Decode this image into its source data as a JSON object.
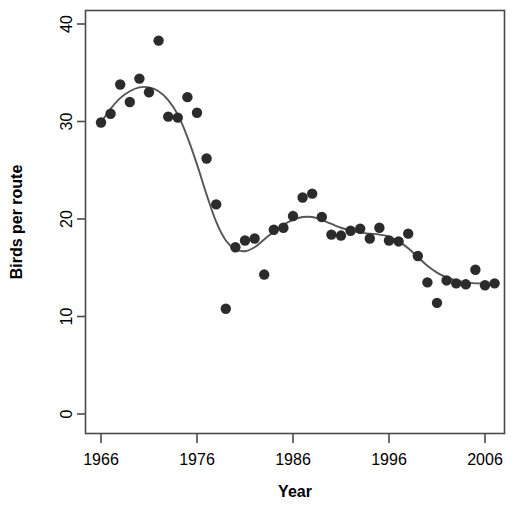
{
  "chart_data": {
    "type": "scatter",
    "title": "",
    "xlabel": "Year",
    "ylabel": "Birds per route",
    "xlim": [
      1965.0,
      2008.0
    ],
    "ylim": [
      0,
      41.5
    ],
    "xticks": [
      1966,
      1976,
      1986,
      1996,
      2006
    ],
    "xtick_labels": [
      "1966",
      "1976",
      "1986",
      "1996",
      "2006"
    ],
    "yticks": [
      0,
      10,
      20,
      30,
      40
    ],
    "ytick_labels": [
      "0",
      "10",
      "20",
      "30",
      "40"
    ],
    "grid": false,
    "legend": null,
    "point_color": "#2b2b2b",
    "line_color": "#555555",
    "frame_color": "#4a4a4a",
    "x": [
      1966,
      1967,
      1968,
      1969,
      1970,
      1971,
      1972,
      1973,
      1974,
      1975,
      1976,
      1977,
      1978,
      1979,
      1980,
      1981,
      1982,
      1983,
      1984,
      1985,
      1986,
      1987,
      1988,
      1989,
      1990,
      1991,
      1992,
      1993,
      1994,
      1995,
      1996,
      1997,
      1998,
      1999,
      2000,
      2001,
      2002,
      2003,
      2004,
      2005,
      2006,
      2007
    ],
    "y": [
      29.9,
      30.8,
      33.8,
      32.0,
      34.4,
      33.0,
      38.3,
      30.5,
      30.4,
      32.5,
      30.9,
      26.2,
      21.5,
      10.8,
      17.1,
      17.8,
      18.0,
      14.3,
      18.9,
      19.1,
      20.3,
      22.2,
      22.6,
      20.2,
      18.4,
      18.3,
      18.8,
      19.0,
      18.0,
      19.1,
      17.8,
      17.7,
      18.5,
      16.2,
      13.5,
      11.4,
      13.7,
      13.4,
      13.3,
      14.8,
      13.2,
      13.4
    ],
    "series": [
      {
        "name": "observed",
        "type": "scatter",
        "values": [
          29.9,
          30.8,
          33.8,
          32.0,
          34.4,
          33.0,
          38.3,
          30.5,
          30.4,
          32.5,
          30.9,
          26.2,
          21.5,
          10.8,
          17.1,
          17.8,
          18.0,
          14.3,
          18.9,
          19.1,
          20.3,
          22.2,
          22.6,
          20.2,
          18.4,
          18.3,
          18.8,
          19.0,
          18.0,
          19.1,
          17.8,
          17.7,
          18.5,
          16.2,
          13.5,
          11.4,
          13.7,
          13.4,
          13.3,
          14.8,
          13.2,
          13.4
        ]
      },
      {
        "name": "smoothed-trend",
        "type": "line",
        "x": [
          1966,
          1967,
          1968,
          1969,
          1970,
          1971,
          1972,
          1973,
          1974,
          1975,
          1976,
          1977,
          1978,
          1979,
          1980,
          1981,
          1982,
          1983,
          1984,
          1985,
          1986,
          1987,
          1988,
          1989,
          1990,
          1991,
          1992,
          1993,
          1994,
          1995,
          1996,
          1997,
          1998,
          1999,
          2000,
          2001,
          2002,
          2003,
          2004,
          2005,
          2006,
          2007
        ],
        "values": [
          29.9,
          31.3,
          32.4,
          33.1,
          33.5,
          33.5,
          33.1,
          32.2,
          30.7,
          28.4,
          25.6,
          22.5,
          19.7,
          17.8,
          16.9,
          16.7,
          17.1,
          17.9,
          18.7,
          19.4,
          19.9,
          20.2,
          20.2,
          19.9,
          19.5,
          19.1,
          18.8,
          18.6,
          18.5,
          18.4,
          18.2,
          17.7,
          17.0,
          16.1,
          15.2,
          14.5,
          14.0,
          13.7,
          13.5,
          13.4,
          13.4,
          13.4
        ]
      }
    ]
  },
  "axes": {
    "x_title": "Year",
    "y_title": "Birds per route"
  }
}
